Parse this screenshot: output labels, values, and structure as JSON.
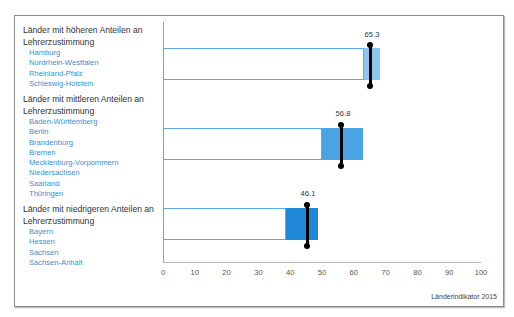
{
  "chart_data": {
    "type": "bar",
    "title": "",
    "xlabel": "",
    "ylabel": "",
    "xlim": [
      0,
      100
    ],
    "xticks": [
      "0",
      "10",
      "20",
      "30",
      "40",
      "50",
      "60",
      "70",
      "80",
      "90",
      "100"
    ],
    "categories": [
      "Länder mit höheren Anteilen an Lehrerzustimmung",
      "Länder mit mittleren Anteilen an Lehrerzustimmung",
      "Länder mit niedrigeren Anteilen an Lehrerzustimmung"
    ],
    "series": [
      {
        "name": "range_start",
        "values": [
          63.2,
          50.0,
          38.7
        ]
      },
      {
        "name": "range_end",
        "values": [
          68.2,
          62.9,
          48.7
        ]
      },
      {
        "name": "value",
        "values": [
          65.3,
          56.8,
          46.1
        ]
      }
    ],
    "groups": [
      {
        "title": "Länder mit höheren Anteilen an Lehrerzustimmung",
        "states": [
          "Hamburg",
          "Nordrhein-Westfalen",
          "Rheinland-Pfalz",
          "Schleswig-Holstein"
        ],
        "value": 65.3,
        "range": [
          63.2,
          68.2
        ],
        "color": "#8ec5ee"
      },
      {
        "title": "Länder mit mittleren Anteilen an Lehrerzustimmung",
        "states": [
          "Baden-Württemberg",
          "Berlin",
          "Brandenburg",
          "Bremen",
          "Mecklenburg-Vorpommern",
          "Niedersachsen",
          "Saarland",
          "Thüringen"
        ],
        "value": 56.8,
        "range": [
          50.0,
          62.9
        ],
        "color": "#4aa3e3"
      },
      {
        "title": "Länder mit niedrigeren Anteilen an Lehrerzustimmung",
        "states": [
          "Bayern",
          "Hessen",
          "Sachsen",
          "Sachsen-Anhalt"
        ],
        "value": 46.1,
        "range": [
          38.7,
          48.7
        ],
        "color": "#1f88d8"
      }
    ],
    "grid": false,
    "source": "Länderindikator 2015"
  },
  "legend": {
    "group1": {
      "title_line1": "Länder mit höheren Anteilen an",
      "title_line2": "Lehrerzustimmung",
      "states": [
        "Hamburg",
        "Nordrhein-Westfalen",
        "Rheinland-Pfalz",
        "Schleswig-Holstein"
      ]
    },
    "group2": {
      "title_line1": "Länder mit mittleren Anteilen an",
      "title_line2": "Lehrerzustimmung",
      "states": [
        "Baden-Württemberg",
        "Berlin",
        "Brandenburg",
        "Bremen",
        "Mecklenburg-Vorpommern",
        "Niedersachsen",
        "Saarland",
        "Thüringen"
      ]
    },
    "group3": {
      "title_line1": "Länder mit niedrigeren Anteilen an",
      "title_line2": "Lehrerzustimmung",
      "states": [
        "Bayern",
        "Hessen",
        "Sachsen",
        "Sachsen-Anhalt"
      ]
    }
  },
  "labels": {
    "v1": "65.3",
    "v2": "56.8",
    "v3": "46.1"
  },
  "source": "Länderindikator 2015"
}
